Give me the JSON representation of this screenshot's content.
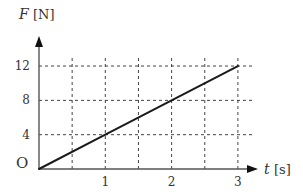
{
  "chart_data": {
    "type": "line",
    "title": "",
    "xlabel": "t [s]",
    "ylabel": "F [N]",
    "xlabel_var": "t",
    "xlabel_unit": "[s]",
    "ylabel_var": "F",
    "ylabel_unit": "[N]",
    "origin_label": "O",
    "x_ticks": [
      1,
      2,
      3
    ],
    "y_ticks": [
      4,
      8,
      12
    ],
    "x_grid": [
      0.5,
      1,
      1.5,
      2,
      2.5,
      3
    ],
    "y_grid": [
      4,
      8,
      12
    ],
    "xlim": [
      0,
      3.3
    ],
    "ylim": [
      0,
      13.5
    ],
    "grid": true,
    "grid_style": "dashed",
    "legend": null,
    "series": [
      {
        "name": "F(t)",
        "x": [
          0,
          1,
          2,
          3
        ],
        "y": [
          0,
          4,
          8,
          12
        ]
      }
    ]
  },
  "layout": {
    "origin_px": [
      39,
      169
    ],
    "x_unit_px": 66.3,
    "y_unit_px": 8.58,
    "x_axis_end_px": 258,
    "y_axis_top_px": 36,
    "colors": {
      "axis": "#555555",
      "grid": "#444444",
      "line": "#1a1a1a",
      "text": "#333333"
    }
  }
}
